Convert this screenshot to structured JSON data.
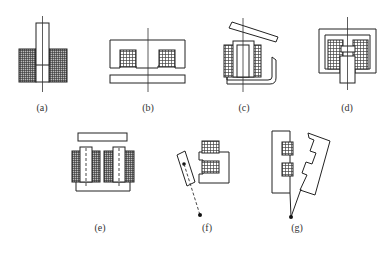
{
  "figure": {
    "panels": [
      {
        "id": "a",
        "label": "(a)",
        "type": "solenoid plunger type"
      },
      {
        "id": "b",
        "label": "(b)",
        "type": "E-core with straight armature"
      },
      {
        "id": "c",
        "label": "(c)",
        "type": "clapper type with hinged armature"
      },
      {
        "id": "d",
        "label": "(d)",
        "type": "shell-type with plunger"
      },
      {
        "id": "e",
        "label": "(e)",
        "type": "U-core with two coils and straight armature"
      },
      {
        "id": "f",
        "label": "(f)",
        "type": "pivoted armature with E-core"
      },
      {
        "id": "g",
        "label": "(g)",
        "type": "pivoted E-armature with E-core"
      }
    ]
  },
  "colors": {
    "line": "#222222",
    "coil_fill": "#888888",
    "background": "#ffffff"
  }
}
